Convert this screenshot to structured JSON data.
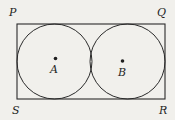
{
  "figure": {
    "background_color": "#f1f0ec",
    "line_color": "#2b2b2b",
    "labels": {
      "top_left": "P",
      "top_right": "Q",
      "bottom_right": "R",
      "bottom_left": "S",
      "center_left": "A",
      "center_right": "B"
    },
    "shapes": {
      "rectangle": {
        "x": 17,
        "y": 24,
        "width": 148,
        "height": 75
      },
      "circles": [
        {
          "name": "circle-A",
          "cx": 54.5,
          "cy": 61.5,
          "r": 37.5
        },
        {
          "name": "circle-B",
          "cx": 127.5,
          "cy": 61.5,
          "r": 37.5
        }
      ],
      "center_dots": [
        {
          "name": "dot-A",
          "cx": 55.5,
          "cy": 58.5,
          "r": 1.8
        },
        {
          "name": "dot-B",
          "cx": 122.5,
          "cy": 61,
          "r": 1.8
        }
      ]
    }
  }
}
